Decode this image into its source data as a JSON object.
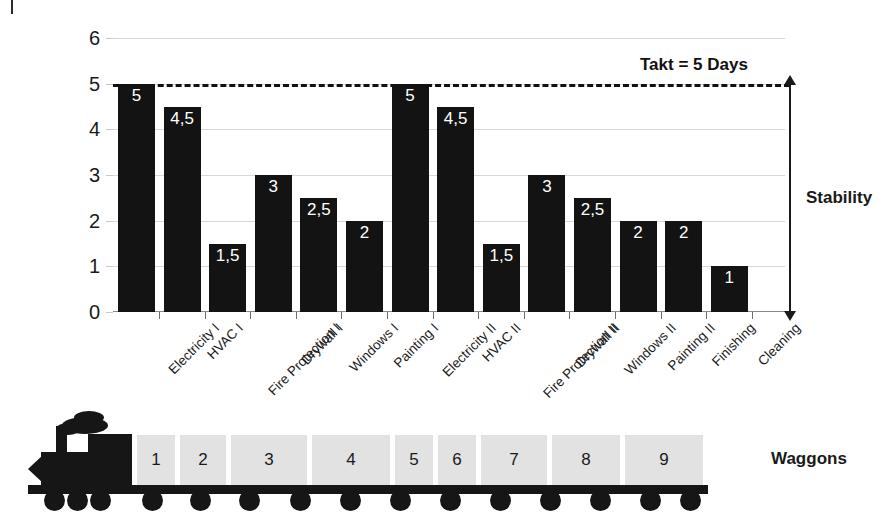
{
  "chart_data": {
    "type": "bar",
    "title": "",
    "xlabel": "",
    "ylabel": "",
    "ylim": [
      0,
      6
    ],
    "yticks": [
      "0",
      "1",
      "2",
      "3",
      "4",
      "5",
      "6"
    ],
    "grid": true,
    "legend": "none",
    "value_decimal_separator": ",",
    "categories": [
      "Electricity I",
      "HVAC I",
      "Fire Protection I",
      "Drywall I",
      "Windows I",
      "Painting I",
      "Electricity II",
      "HVAC II",
      "Fire Protection II",
      "Drywall II",
      "Windows II",
      "Painting II",
      "Finishing",
      "Cleaning"
    ],
    "values": [
      5,
      4.5,
      1.5,
      3,
      2.5,
      2,
      5,
      4.5,
      1.5,
      3,
      2.5,
      2,
      2,
      1
    ],
    "value_labels": [
      "5",
      "4,5",
      "1,5",
      "3",
      "2,5",
      "2",
      "5",
      "4,5",
      "1,5",
      "3",
      "2,5",
      "2",
      "2",
      "1"
    ],
    "bar_color": "#131313",
    "value_label_color": "#ffffff",
    "annotations": [
      {
        "name": "takt-line",
        "label": "Takt = 5 Days",
        "value": 5,
        "style": "dashed-horizontal-line"
      },
      {
        "name": "stability-range",
        "label": "Stability",
        "from": 0,
        "to": 5,
        "style": "double-headed-vertical-arrow"
      }
    ]
  },
  "train": {
    "label": "Waggons",
    "waggons": [
      "1",
      "2",
      "3",
      "4",
      "5",
      "6",
      "7",
      "8",
      "9"
    ],
    "waggon_color": "#e2e2e2",
    "locomotive_color": "#161616"
  }
}
